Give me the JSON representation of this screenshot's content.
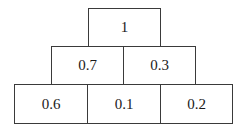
{
  "pyramid": {
    "rows": [
      {
        "cells": [
          {
            "value": "1"
          }
        ]
      },
      {
        "cells": [
          {
            "value": "0.7"
          },
          {
            "value": "0.3"
          }
        ]
      },
      {
        "cells": [
          {
            "value": "0.6"
          },
          {
            "value": "0.1"
          },
          {
            "value": "0.2"
          }
        ]
      }
    ]
  }
}
